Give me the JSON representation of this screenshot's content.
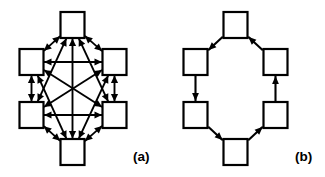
{
  "figure": {
    "background_color": "#ffffff",
    "stroke_color": "#000000",
    "node_fill_color": "#ffffff",
    "panels": [
      {
        "id": "a",
        "label": "(a)",
        "label_position": {
          "x": 133,
          "y": 161
        },
        "topology": "fully-connected",
        "edge_style": "bidirectional",
        "node_count": 6,
        "edge_count": 15
      },
      {
        "id": "b",
        "label": "(b)",
        "label_position": {
          "x": 133,
          "y": 161
        },
        "topology": "directed-ring",
        "edge_style": "unidirectional",
        "node_count": 6,
        "edge_count": 6
      }
    ]
  },
  "chart_data": {
    "type": "diagram",
    "title": "",
    "subtitle": "",
    "panels": [
      {
        "id": "a",
        "label": "(a)",
        "graph_type": "complete-graph",
        "directed": true,
        "bidirectional": true,
        "nodes": [
          {
            "id": "n1",
            "name": "top",
            "x": 72.5,
            "y": 25,
            "w": 24,
            "h": 26
          },
          {
            "id": "n2",
            "name": "upper-left",
            "x": 31.5,
            "y": 62,
            "w": 24,
            "h": 26
          },
          {
            "id": "n3",
            "name": "upper-right",
            "x": 114.5,
            "y": 62,
            "w": 24,
            "h": 26
          },
          {
            "id": "n4",
            "name": "lower-left",
            "x": 31.5,
            "y": 115,
            "w": 24,
            "h": 26
          },
          {
            "id": "n5",
            "name": "lower-right",
            "x": 114.5,
            "y": 115,
            "w": 24,
            "h": 26
          },
          {
            "id": "n6",
            "name": "bottom",
            "x": 72.5,
            "y": 152,
            "w": 24,
            "h": 26
          }
        ],
        "edges": [
          {
            "from": "n1",
            "to": "n2",
            "arrows": "both"
          },
          {
            "from": "n1",
            "to": "n3",
            "arrows": "both"
          },
          {
            "from": "n1",
            "to": "n4",
            "arrows": "both"
          },
          {
            "from": "n1",
            "to": "n5",
            "arrows": "both"
          },
          {
            "from": "n1",
            "to": "n6",
            "arrows": "both"
          },
          {
            "from": "n2",
            "to": "n3",
            "arrows": "both"
          },
          {
            "from": "n2",
            "to": "n4",
            "arrows": "both"
          },
          {
            "from": "n2",
            "to": "n5",
            "arrows": "both"
          },
          {
            "from": "n2",
            "to": "n6",
            "arrows": "both"
          },
          {
            "from": "n3",
            "to": "n4",
            "arrows": "both"
          },
          {
            "from": "n3",
            "to": "n5",
            "arrows": "both"
          },
          {
            "from": "n3",
            "to": "n6",
            "arrows": "both"
          },
          {
            "from": "n4",
            "to": "n5",
            "arrows": "both"
          },
          {
            "from": "n4",
            "to": "n6",
            "arrows": "both"
          },
          {
            "from": "n5",
            "to": "n6",
            "arrows": "both"
          }
        ]
      },
      {
        "id": "b",
        "label": "(b)",
        "graph_type": "ring",
        "directed": true,
        "bidirectional": false,
        "nodes": [
          {
            "id": "m1",
            "name": "top",
            "x": 73.5,
            "y": 25,
            "w": 24,
            "h": 26
          },
          {
            "id": "m2",
            "name": "upper-left",
            "x": 33.5,
            "y": 62,
            "w": 24,
            "h": 26
          },
          {
            "id": "m3",
            "name": "upper-right",
            "x": 113.5,
            "y": 62,
            "w": 24,
            "h": 26
          },
          {
            "id": "m4",
            "name": "lower-left",
            "x": 33.5,
            "y": 115,
            "w": 24,
            "h": 26
          },
          {
            "id": "m5",
            "name": "lower-right",
            "x": 113.5,
            "y": 115,
            "w": 24,
            "h": 26
          },
          {
            "id": "m6",
            "name": "bottom",
            "x": 73.5,
            "y": 152,
            "w": 24,
            "h": 26
          }
        ],
        "edges": [
          {
            "from": "m1",
            "to": "m2",
            "arrows": "to"
          },
          {
            "from": "m2",
            "to": "m4",
            "arrows": "to"
          },
          {
            "from": "m4",
            "to": "m6",
            "arrows": "to"
          },
          {
            "from": "m6",
            "to": "m5",
            "arrows": "to"
          },
          {
            "from": "m5",
            "to": "m3",
            "arrows": "to"
          },
          {
            "from": "m3",
            "to": "m1",
            "arrows": "to"
          }
        ]
      }
    ]
  }
}
